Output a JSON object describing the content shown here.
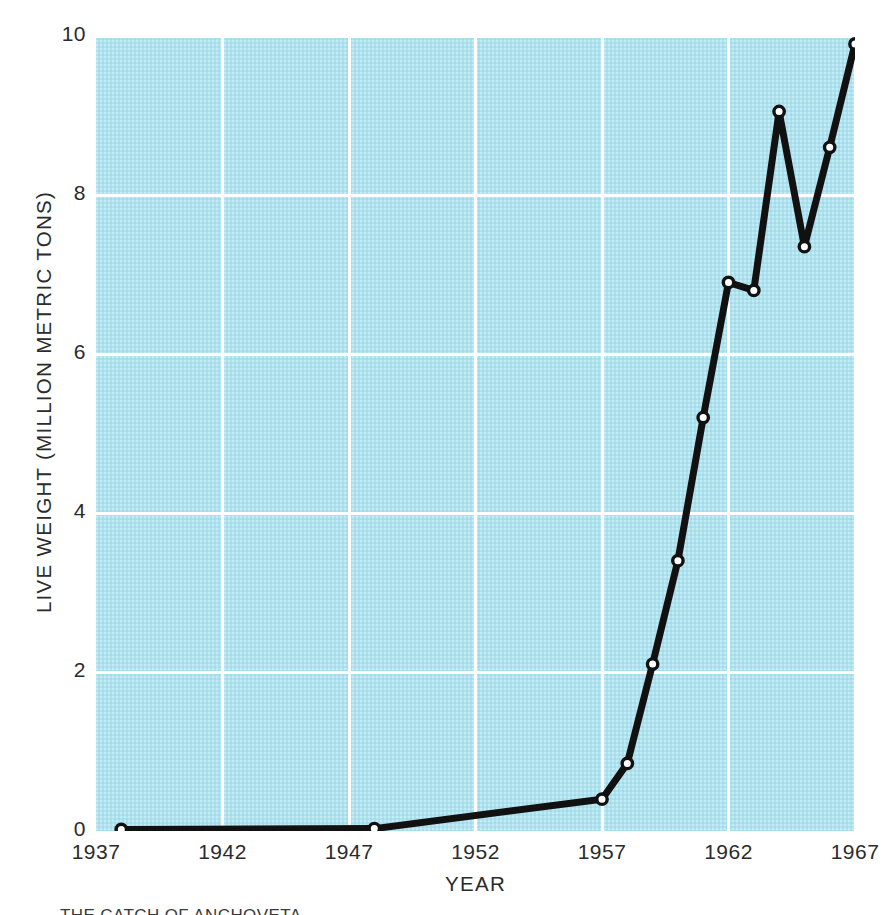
{
  "chart_data": {
    "type": "line",
    "title": "",
    "xlabel": "YEAR",
    "ylabel": "LIVE WEIGHT (MILLION METRIC TONS)",
    "xlim": [
      1937,
      1967
    ],
    "ylim": [
      0,
      10
    ],
    "xticks": [
      "1937",
      "1942",
      "1947",
      "1952",
      "1957",
      "1962",
      "1967"
    ],
    "xtick_values": [
      1937,
      1942,
      1947,
      1952,
      1957,
      1962,
      1967
    ],
    "yticks": [
      "0",
      "2",
      "4",
      "6",
      "8",
      "10"
    ],
    "ytick_values": [
      0,
      2,
      4,
      6,
      8,
      10
    ],
    "grid": true,
    "grid_color": "#ffffff",
    "plot_background": "#ade2ef",
    "line_color": "#111111",
    "marker": "open-circle",
    "marker_face_color": "#ffffff",
    "legend": "none",
    "x": [
      1938,
      1948,
      1957,
      1958,
      1959,
      1960,
      1961,
      1962,
      1963,
      1964,
      1965,
      1966,
      1967
    ],
    "values": [
      0.02,
      0.03,
      0.4,
      0.85,
      2.1,
      3.4,
      5.2,
      6.9,
      6.8,
      9.05,
      7.35,
      8.6,
      9.9
    ],
    "series": [
      {
        "name": "Live weight",
        "points": [
          {
            "x": 1938,
            "y": 0.02
          },
          {
            "x": 1948,
            "y": 0.03
          },
          {
            "x": 1957,
            "y": 0.4
          },
          {
            "x": 1958,
            "y": 0.85
          },
          {
            "x": 1959,
            "y": 2.1
          },
          {
            "x": 1960,
            "y": 3.4
          },
          {
            "x": 1961,
            "y": 5.2
          },
          {
            "x": 1962,
            "y": 6.9
          },
          {
            "x": 1963,
            "y": 6.8
          },
          {
            "x": 1964,
            "y": 9.05
          },
          {
            "x": 1965,
            "y": 7.35
          },
          {
            "x": 1966,
            "y": 8.6
          },
          {
            "x": 1967,
            "y": 9.9
          }
        ]
      }
    ]
  },
  "caption": {
    "partial_text": "THE CATCH OF ANCHOVETA"
  }
}
